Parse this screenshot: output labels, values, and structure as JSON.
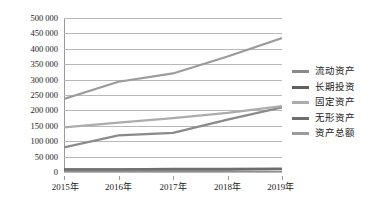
{
  "chart_data": {
    "type": "line",
    "title": "",
    "xlabel": "",
    "ylabel": "",
    "categories": [
      "2015年",
      "2016年",
      "2017年",
      "2018年",
      "2019年"
    ],
    "ylim": [
      0,
      500000
    ],
    "ytick_step": 50000,
    "ytick_labels": [
      "0",
      "50 000",
      "100 000",
      "150 000",
      "200 000",
      "250 000",
      "300 000",
      "350 000",
      "400 000",
      "450 000",
      "500 000"
    ],
    "ytick_values": [
      0,
      50000,
      100000,
      150000,
      200000,
      250000,
      300000,
      350000,
      400000,
      450000,
      500000
    ],
    "grid": true,
    "legend_position": "right",
    "series": [
      {
        "name": "流动资产",
        "color": "#8a8a8a",
        "values": [
          80000,
          119000,
          127000,
          170000,
          210000
        ]
      },
      {
        "name": "长期投资",
        "color": "#5f5f5f",
        "values": [
          8000,
          8000,
          8000,
          8000,
          9000
        ]
      },
      {
        "name": "固定资产",
        "color": "#acacac",
        "values": [
          145000,
          160000,
          175000,
          192000,
          214000
        ]
      },
      {
        "name": "无形资产",
        "color": "#6e6e6e",
        "values": [
          9000,
          9000,
          10000,
          10000,
          11000
        ]
      },
      {
        "name": "资产总额",
        "color": "#9b9b9b",
        "values": [
          237000,
          293000,
          320000,
          375000,
          435000
        ]
      }
    ]
  }
}
